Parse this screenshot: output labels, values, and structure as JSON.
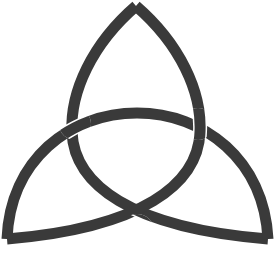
{
  "image": {
    "subject": "Triquetra (trinity knot) symbol",
    "background_color": "#ffffff",
    "stroke_color": "#3a3a3a",
    "gap_color": "#ffffff",
    "stroke_width": 11
  },
  "symbol": {
    "name": "triquetra",
    "tips": {
      "top": [
        136,
        6
      ],
      "bottom_left": [
        7,
        239
      ],
      "bottom_right": [
        268,
        239
      ]
    },
    "arcs": [
      {
        "id": "arc-top-to-bottom-right",
        "path": "M136,6 C92,44 70,92 72,132 C74,184 130,228 268,239"
      },
      {
        "id": "arc-top-to-bottom-left",
        "path": "M136,6 C180,44 202,92 200,132 C198,184 142,228 7,239"
      },
      {
        "id": "arc-bottom-left-to-bottom-right",
        "path": "M7,239 C10,160 70,113 137,113 C204,113 264,160 268,239"
      }
    ],
    "crossings": [
      {
        "position": "left",
        "at": [
          75,
          124
        ],
        "over": "arc-bottom-left-to-bottom-right"
      },
      {
        "position": "right",
        "at": [
          197,
          124
        ],
        "over": "arc-top-to-bottom-left"
      },
      {
        "position": "bottom",
        "at": [
          137,
          232
        ],
        "over": "arc-top-to-bottom-right"
      }
    ]
  }
}
